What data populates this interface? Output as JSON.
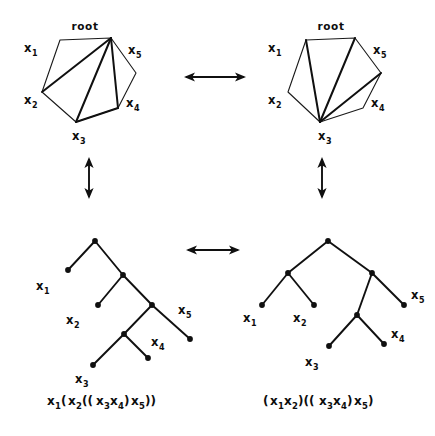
{
  "figure": {
    "background_color": "#ffffff",
    "ink_color": "#101010"
  },
  "labels": {
    "root": "root",
    "x_base": "x",
    "x1_sub": "1",
    "x2_sub": "2",
    "x3_sub": "3",
    "x4_sub": "4",
    "x5_sub": "5"
  },
  "polygons": [
    {
      "name": "hexagon-left",
      "position": "top-left",
      "root_label": "root",
      "root_edge": "top",
      "vertex_labels": [
        "x1",
        "x2",
        "x3",
        "x4",
        "x5"
      ],
      "edge_labels": {
        "upper_left": "x1",
        "lower_left": "x2",
        "bottom": "x3",
        "lower_right": "x4",
        "upper_right": "x5"
      },
      "triangulation_description": "three diagonals drawn from the top-right vertex",
      "diagonal_count": 3
    },
    {
      "name": "hexagon-right",
      "position": "top-right",
      "root_label": "root",
      "root_edge": "top",
      "vertex_labels": [
        "x1",
        "x2",
        "x3",
        "x4",
        "x5"
      ],
      "edge_labels": {
        "upper_left": "x1",
        "lower_left": "x2",
        "bottom": "x3",
        "lower_right": "x4",
        "upper_right": "x5"
      },
      "triangulation_description": "three diagonals drawn from the bottom vertex",
      "diagonal_count": 3
    }
  ],
  "trees": [
    {
      "name": "tree-left",
      "position": "bottom-left",
      "shape": "right-leaning comb",
      "leaf_labels": [
        "x1",
        "x2",
        "x3",
        "x4",
        "x5"
      ],
      "internal_node_count": 4,
      "leaf_count": 5,
      "bracketing": "x1(x2((x3x4)x5))"
    },
    {
      "name": "tree-right",
      "position": "bottom-right",
      "shape": "balanced",
      "leaf_labels": [
        "x1",
        "x2",
        "x3",
        "x4",
        "x5"
      ],
      "internal_node_count": 4,
      "leaf_count": 5,
      "bracketing": "(x1x2)((x3x4)x5)"
    }
  ],
  "formulas": {
    "left": {
      "name": "formula-left",
      "tokens": [
        {
          "t": "x",
          "sub": "1"
        },
        {
          "t": "(",
          "sub": ""
        },
        {
          "t": "x",
          "sub": "2"
        },
        {
          "t": "((",
          "sub": ""
        },
        {
          "t": "x",
          "sub": "3"
        },
        {
          "t": "x",
          "sub": "4"
        },
        {
          "t": ")",
          "sub": ""
        },
        {
          "t": "x",
          "sub": "5"
        },
        {
          "t": "))",
          "sub": ""
        }
      ],
      "plain": "x1(x2((x3x4)x5))"
    },
    "right": {
      "name": "formula-right",
      "tokens": [
        {
          "t": "(",
          "sub": ""
        },
        {
          "t": "x",
          "sub": "1"
        },
        {
          "t": "x",
          "sub": "2"
        },
        {
          "t": ")((",
          "sub": ""
        },
        {
          "t": "x",
          "sub": "3"
        },
        {
          "t": "x",
          "sub": "4"
        },
        {
          "t": ")",
          "sub": ""
        },
        {
          "t": "x",
          "sub": "5"
        },
        {
          "t": ")",
          "sub": ""
        }
      ],
      "plain": "(x1x2)((x3x4)x5)"
    }
  },
  "arrows": [
    {
      "name": "arrow-top-horizontal",
      "orientation": "horizontal",
      "heads": "both",
      "connects": [
        "hexagon-left",
        "hexagon-right"
      ]
    },
    {
      "name": "arrow-left-vertical",
      "orientation": "vertical",
      "heads": "both",
      "connects": [
        "hexagon-left",
        "tree-left"
      ]
    },
    {
      "name": "arrow-right-vertical",
      "orientation": "vertical",
      "heads": "both",
      "connects": [
        "hexagon-right",
        "tree-right"
      ]
    },
    {
      "name": "arrow-bottom-horizontal",
      "orientation": "horizontal",
      "heads": "both",
      "connects": [
        "tree-left",
        "tree-right"
      ]
    }
  ]
}
